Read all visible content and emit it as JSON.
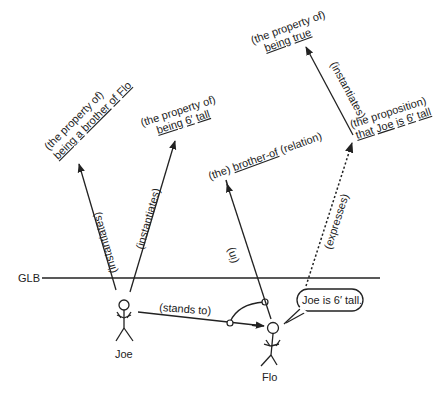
{
  "glb": {
    "label": "GLB"
  },
  "people": {
    "joe": {
      "name": "Joe"
    },
    "flo": {
      "name": "Flo"
    }
  },
  "speech_bubble": {
    "text": "Joe is 6′ tall."
  },
  "nodes": {
    "brother_property": {
      "line1": "(the property of)",
      "line2_parts": [
        "being",
        " ",
        "a",
        " ",
        "brother",
        " ",
        "of",
        " ",
        "Flo"
      ]
    },
    "tall_property": {
      "line1": "(the property of)",
      "line2_parts": [
        "being",
        " ",
        "6′",
        " ",
        "tall"
      ]
    },
    "brother_relation": {
      "prefix": "(the) ",
      "underlined": "brother-of",
      "suffix": " (relation)"
    },
    "proposition": {
      "line1": "(the proposition)",
      "line2_parts": [
        "that",
        " ",
        "Joe",
        " ",
        "is",
        " ",
        "6′",
        " ",
        "tall"
      ]
    },
    "true_property": {
      "line1": "(the property of)",
      "line2_parts": [
        "being",
        " ",
        "true"
      ]
    }
  },
  "edges": {
    "joe_instantiates_brother": "(instantiates)",
    "joe_instantiates_tall": "(instantiates)",
    "stands_to": "(stands to)",
    "in": "(in)",
    "expresses": "(expresses)",
    "prop_instantiates_true": "(instantiates)"
  },
  "colors": {
    "ink": "#222222",
    "background": "#ffffff"
  }
}
